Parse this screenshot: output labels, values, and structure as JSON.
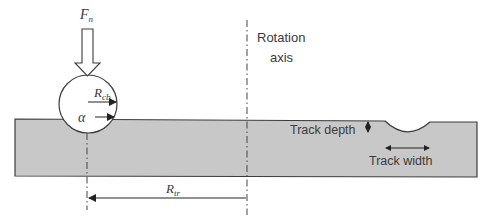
{
  "diagram": {
    "labels": {
      "normal_force": "F",
      "normal_force_sub": "n",
      "ball_radius": "R",
      "ball_radius_sub": "cb",
      "angle": "α",
      "rotation_axis_line1": "Rotation",
      "rotation_axis_line2": "axis",
      "track_depth": "Track depth",
      "track_width": "Track width",
      "track_radius": "R",
      "track_radius_sub": "tr"
    },
    "colors": {
      "disc_fill": "#c8c8c8",
      "stroke": "#3c3c3c",
      "background": "#ffffff"
    }
  }
}
